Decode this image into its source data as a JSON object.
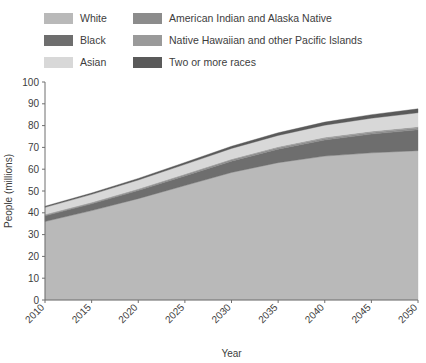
{
  "legend": {
    "columns": [
      [
        {
          "label": "White",
          "color": "#b9b9b9",
          "key": "white"
        },
        {
          "label": "Black",
          "color": "#6e6e6e",
          "key": "black"
        },
        {
          "label": "Asian",
          "color": "#d8d8d8",
          "key": "asian"
        }
      ],
      [
        {
          "label": "American Indian and Alaska Native",
          "color": "#8c8c8c",
          "key": "american_indian_alaska_native"
        },
        {
          "label": "Native Hawaiian and other Pacific Islands",
          "color": "#9a9a9a",
          "key": "native_hawaiian_pacific"
        },
        {
          "label": "Two or more races",
          "color": "#5a5a5a",
          "key": "two_or_more"
        }
      ]
    ]
  },
  "chart_data": {
    "type": "area",
    "stacked": true,
    "title": "",
    "xlabel": "Year",
    "ylabel": "People (millions)",
    "x": [
      2010,
      2015,
      2020,
      2025,
      2030,
      2035,
      2040,
      2045,
      2050
    ],
    "xtick_labels": [
      "2010",
      "2015",
      "2020",
      "2025",
      "2030",
      "2035",
      "2040",
      "2045",
      "2050"
    ],
    "ytick_labels": [
      "0",
      "10",
      "20",
      "30",
      "40",
      "50",
      "60",
      "70",
      "80",
      "90",
      "100"
    ],
    "ylim": [
      0,
      100
    ],
    "xlim": [
      2010,
      2050
    ],
    "grid": false,
    "legend_position": "top",
    "series": [
      {
        "name": "White",
        "color": "#b9b9b9",
        "values": [
          36.0,
          41.0,
          46.5,
          52.5,
          58.5,
          63.0,
          66.0,
          67.5,
          68.5
        ]
      },
      {
        "name": "Black",
        "color": "#6e6e6e",
        "values": [
          2.6,
          3.1,
          3.7,
          4.4,
          5.2,
          6.2,
          7.4,
          8.6,
          9.6
        ]
      },
      {
        "name": "American Indian and Alaska Native",
        "color": "#8c8c8c",
        "values": [
          0.4,
          0.45,
          0.5,
          0.55,
          0.6,
          0.65,
          0.7,
          0.75,
          0.8
        ]
      },
      {
        "name": "Native Hawaiian and other Pacific Islands",
        "color": "#9a9a9a",
        "values": [
          0.3,
          0.32,
          0.35,
          0.38,
          0.42,
          0.45,
          0.5,
          0.55,
          0.6
        ]
      },
      {
        "name": "Asian",
        "color": "#d8d8d8",
        "values": [
          3.2,
          3.6,
          4.0,
          4.4,
          4.8,
          5.2,
          5.6,
          6.0,
          6.4
        ]
      },
      {
        "name": "Two or more races",
        "color": "#5a5a5a",
        "values": [
          0.5,
          0.6,
          0.7,
          0.85,
          1.0,
          1.2,
          1.4,
          1.6,
          1.8
        ]
      }
    ],
    "totals": [
      43.0,
      49.1,
      55.8,
      63.1,
      70.5,
      76.7,
      81.6,
      85.0,
      87.7
    ]
  }
}
